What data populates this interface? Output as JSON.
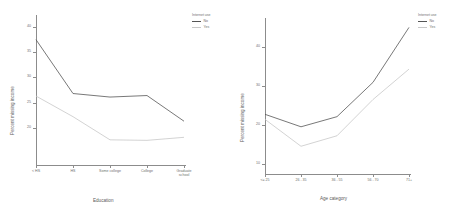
{
  "chart_data": [
    {
      "type": "line",
      "title": "",
      "xlabel": "Education",
      "ylabel": "Percent missing income",
      "categories": [
        "< HS",
        "HS",
        "Some college",
        "College",
        "Graduate school"
      ],
      "ylim": [
        13,
        42
      ],
      "yticks": [
        "40",
        "35",
        "30",
        "25",
        "20"
      ],
      "ytick_values": [
        40,
        35,
        30,
        25,
        20
      ],
      "grid": false,
      "legend_position": "right",
      "legend_title": "Internet use",
      "series": [
        {
          "name": "No",
          "color": "#555555",
          "values": [
            37.5,
            26.8,
            26.1,
            26.4,
            21.3
          ]
        },
        {
          "name": "Yes",
          "color": "#c8c8c8",
          "values": [
            26.3,
            22.2,
            17.6,
            17.5,
            18.1
          ]
        }
      ]
    },
    {
      "type": "line",
      "title": "",
      "xlabel": "Age category",
      "ylabel": "Percent missing income",
      "categories": [
        "<= 25",
        "26 - 35",
        "36 - 55",
        "56 - 70",
        "71+"
      ],
      "ylim": [
        8,
        47
      ],
      "yticks": [
        "40",
        "30",
        "20",
        "10"
      ],
      "ytick_values": [
        40,
        30,
        20,
        10
      ],
      "grid": false,
      "legend_position": "right",
      "legend_title": "Internet use",
      "series": [
        {
          "name": "No",
          "color": "#555555",
          "values": [
            22.8,
            19.6,
            22.2,
            31.0,
            45.1
          ]
        },
        {
          "name": "Yes",
          "color": "#c8c8c8",
          "values": [
            21.5,
            14.6,
            17.3,
            26.6,
            34.4
          ]
        }
      ]
    }
  ],
  "panels": [
    {
      "id": "education-panel",
      "xlabel": "Education",
      "ylabel": "Percent missing income",
      "legend_title": "Internet use",
      "legend": [
        {
          "label": "No",
          "color": "#555555"
        },
        {
          "label": "Yes",
          "color": "#c8c8c8"
        }
      ],
      "yticks": [
        "40",
        "35",
        "30",
        "25",
        "20"
      ],
      "xticks": [
        "< HS",
        "HS",
        "Some college",
        "College",
        "Graduate school"
      ]
    },
    {
      "id": "age-panel",
      "xlabel": "Age category",
      "ylabel": "Percent missing income",
      "legend_title": "Internet use",
      "legend": [
        {
          "label": "No",
          "color": "#555555"
        },
        {
          "label": "Yes",
          "color": "#c8c8c8"
        }
      ],
      "yticks": [
        "40",
        "30",
        "20",
        "10"
      ],
      "xticks": [
        "<= 25",
        "26 - 35",
        "36 - 55",
        "56 - 70",
        "71+"
      ]
    }
  ]
}
